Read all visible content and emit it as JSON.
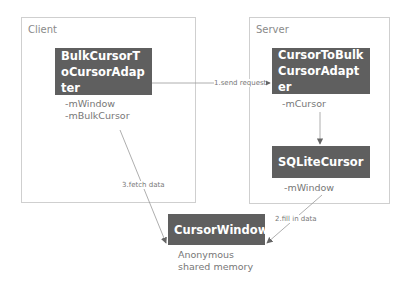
{
  "groups": {
    "client": {
      "label": "Client"
    },
    "server": {
      "label": "Server"
    }
  },
  "nodes": {
    "bulk_adapter": {
      "title": "BulkCursorToCursorAdapter",
      "fields": "-mWindow\n-mBulkCursor"
    },
    "cursor_to_bulk": {
      "title": "CursorToBulkCursorAdapter",
      "fields": "-mCursor"
    },
    "sqlite_cursor": {
      "title": "SQLiteCursor",
      "fields": "-mWindow"
    },
    "cursor_window": {
      "title": "CursorWindow",
      "fields": "Anonymous\nshared memory"
    }
  },
  "edges": {
    "send_request": "1.send request",
    "fill_data": "2.fill in data",
    "fetch_data": "3.fetch data"
  },
  "colors": {
    "node_fill": "#5f5f5f",
    "border": "#cfcfcf",
    "line": "#888888"
  }
}
